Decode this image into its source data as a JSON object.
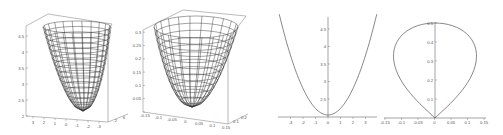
{
  "chart_data": [
    {
      "type": "surface3d",
      "title": "",
      "description": "Wireframe 3D paraboloid surface (bowl shape)",
      "zlabel": "",
      "z_ticks": [
        "2",
        "2.5",
        "3",
        "3.5",
        "4",
        "4.5"
      ],
      "x_ticks": [
        "3",
        "2",
        "1",
        "0",
        "-1",
        "-2",
        "-3"
      ],
      "y_ticks": [
        "2",
        "6"
      ],
      "zlim": [
        2,
        4.6
      ]
    },
    {
      "type": "surface3d",
      "title": "",
      "description": "Wireframe 3D paraboloid surface (bowl shape), narrower domain",
      "z_ticks": [
        "0",
        "0.05",
        "0.1",
        "0.15",
        "0.2",
        "0.25",
        "0.3"
      ],
      "x_ticks": [
        "-0.15",
        "-0.1",
        "-0.05",
        "0",
        "0.05",
        "0.1",
        "0.15"
      ],
      "y_ticks": [
        "0.1",
        "0.2"
      ],
      "zlim": [
        0,
        0.3
      ]
    },
    {
      "type": "line",
      "title": "",
      "description": "2D parabola cross-section",
      "x_ticks": [
        "-3",
        "-2",
        "-1",
        "0",
        "1",
        "2",
        "3"
      ],
      "y_ticks": [
        "2.5",
        "3",
        "3.5",
        "4",
        "4.5"
      ],
      "xlim": [
        -4,
        4
      ],
      "ylim": [
        2,
        4.8
      ],
      "series": [
        {
          "name": "curve",
          "x": [
            -3.8,
            -3,
            -2,
            -1,
            0,
            1,
            2,
            3,
            3.8
          ],
          "y": [
            4.8,
            4.25,
            3.5,
            2.75,
            2.02,
            2.75,
            3.5,
            4.25,
            4.8
          ]
        }
      ]
    },
    {
      "type": "line",
      "title": "",
      "description": "2D closed teardrop/loop curve",
      "x_ticks": [
        "-0.15",
        "-0.1",
        "-0.05",
        "0",
        "0.05",
        "0.1",
        "0.15"
      ],
      "y_ticks": [
        "0.1",
        "0.2",
        "0.3",
        "0.4",
        "0.5"
      ],
      "xlim": [
        -0.15,
        0.15
      ],
      "ylim": [
        0,
        0.5
      ],
      "series": [
        {
          "name": "loop",
          "x": [
            0,
            -0.08,
            -0.14,
            -0.12,
            -0.05,
            0,
            0.05,
            0.12,
            0.14,
            0.08,
            0
          ],
          "y": [
            0,
            0.1,
            0.3,
            0.4,
            0.48,
            0.5,
            0.48,
            0.4,
            0.3,
            0.1,
            0
          ]
        }
      ]
    }
  ],
  "panels": {
    "p1": {
      "z_ticks": [
        "2",
        "2.5",
        "3",
        "3.5",
        "4",
        "4.5"
      ],
      "x_ticks": [
        "3",
        "2",
        "1",
        "0",
        "-1",
        "-2",
        "-3"
      ],
      "y_ticks": [
        "2",
        "6"
      ]
    },
    "p2": {
      "z_ticks": [
        "0",
        "0.05",
        "0.1",
        "0.15",
        "0.2",
        "0.25",
        "0.3"
      ],
      "x_ticks": [
        "-0.15",
        "-0.1",
        "-0.05",
        "0",
        "0.05",
        "0.1",
        "0.15"
      ],
      "y_ticks": [
        "0.1",
        "0.2"
      ]
    },
    "p3": {
      "x_ticks": [
        "-3",
        "-2",
        "-1",
        "0",
        "1",
        "2",
        "3"
      ],
      "y_ticks": [
        "2.5",
        "3",
        "3.5",
        "4",
        "4.5"
      ]
    },
    "p4": {
      "x_ticks": [
        "-0.15",
        "-0.1",
        "-0.05",
        "0",
        "0.05",
        "0.1",
        "0.15"
      ],
      "y_ticks": [
        "0.1",
        "0.2",
        "0.3",
        "0.4",
        "0.5"
      ]
    }
  },
  "colors": {
    "line": "#444444",
    "mesh": "#333333",
    "axis": "#666666"
  }
}
